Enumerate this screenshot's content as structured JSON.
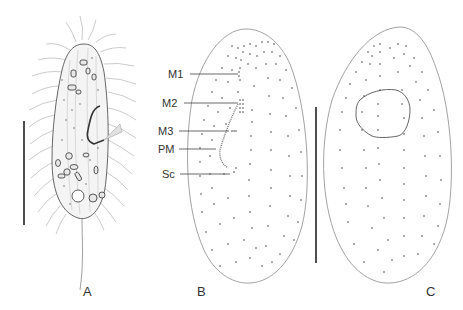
{
  "figure": {
    "panels": [
      {
        "id": "A",
        "label": "A",
        "description": "live ciliate, lateral view with cirri, vacuoles and caudal cilium",
        "label_pos": [
          56,
          295
        ]
      },
      {
        "id": "B",
        "label": "B",
        "description": "ventral infraciliature",
        "label_pos": [
          196,
          295
        ]
      },
      {
        "id": "C",
        "label": "C",
        "description": "dorsal infraciliature with macronucleus",
        "label_pos": [
          427,
          295
        ]
      }
    ],
    "structure_labels": [
      {
        "id": "M1",
        "text": "M1",
        "x": 168,
        "y": 69,
        "line_x1": 190,
        "line_x2": 238,
        "line_y": 74
      },
      {
        "id": "M2",
        "text": "M2",
        "x": 162,
        "y": 98,
        "line_x1": 184,
        "line_x2": 238,
        "line_y": 103
      },
      {
        "id": "M3",
        "text": "M3",
        "x": 158,
        "y": 126,
        "line_x1": 179,
        "line_x2": 229,
        "line_y": 131
      },
      {
        "id": "PM",
        "text": "PM",
        "x": 158,
        "y": 144,
        "line_x1": 179,
        "line_x2": 216,
        "line_y": 149
      },
      {
        "id": "Sc",
        "text": "Sc",
        "x": 162,
        "y": 169,
        "line_x1": 180,
        "line_x2": 230,
        "line_y": 174
      }
    ],
    "scale_bars": [
      {
        "panel": "A",
        "x": 24,
        "y1": 121,
        "y2": 225
      },
      {
        "panel": "B-C",
        "x": 316,
        "y1": 107,
        "y2": 263
      }
    ],
    "colors": {
      "ink": "#333333",
      "outline": "#8a8a8a",
      "dots": "#444444",
      "cilia": "#a0a0a0"
    }
  }
}
